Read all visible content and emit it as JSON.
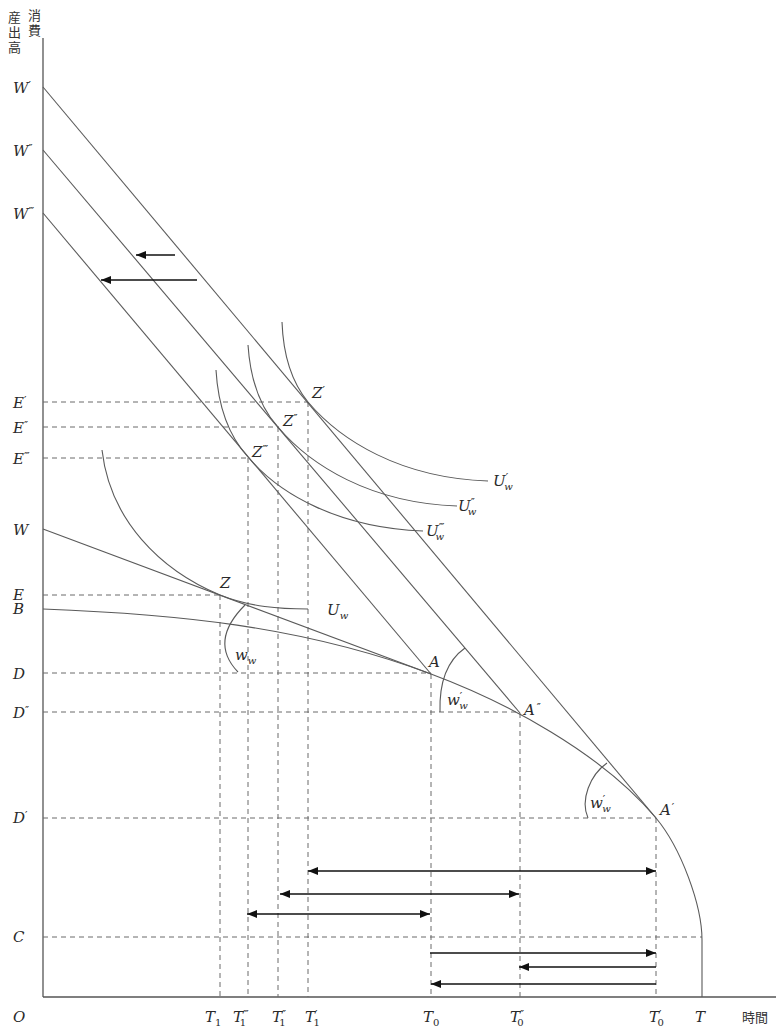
{
  "axis": {
    "y_title_col1": [
      "産",
      "出",
      "高"
    ],
    "y_title_col2": [
      "消",
      "費"
    ],
    "x_title": "時間",
    "origin": "O"
  },
  "y_axis_labels": [
    {
      "base": "W",
      "mark": "′"
    },
    {
      "base": "W",
      "mark": "″"
    },
    {
      "base": "W",
      "mark": "‴"
    },
    {
      "base": "E",
      "mark": "′"
    },
    {
      "base": "E",
      "mark": "″"
    },
    {
      "base": "E",
      "mark": "‴"
    },
    {
      "base": "W",
      "mark": ""
    },
    {
      "base": "E",
      "mark": ""
    },
    {
      "base": "B",
      "mark": ""
    },
    {
      "base": "D",
      "mark": ""
    },
    {
      "base": "D",
      "mark": "″"
    },
    {
      "base": "D",
      "mark": "′"
    },
    {
      "base": "C",
      "mark": ""
    }
  ],
  "x_axis_labels": [
    {
      "base": "T",
      "sub": "1",
      "mark": ""
    },
    {
      "base": "T",
      "sub": "1",
      "mark": "‴"
    },
    {
      "base": "T",
      "sub": "1",
      "mark": "″"
    },
    {
      "base": "T",
      "sub": "1",
      "mark": "′"
    },
    {
      "base": "T",
      "sub": "0",
      "mark": ""
    },
    {
      "base": "T",
      "sub": "0",
      "mark": "″"
    },
    {
      "base": "T",
      "sub": "0",
      "mark": "′"
    },
    {
      "base": "T",
      "sub": "",
      "mark": ""
    }
  ],
  "point_labels": [
    {
      "base": "Z",
      "mark": "′"
    },
    {
      "base": "Z",
      "mark": "″"
    },
    {
      "base": "Z",
      "mark": "‴"
    },
    {
      "base": "Z",
      "mark": ""
    },
    {
      "base": "A",
      "mark": ""
    },
    {
      "base": "A",
      "mark": "″"
    },
    {
      "base": "A",
      "mark": "′"
    }
  ],
  "curve_labels": [
    {
      "base": "U",
      "mark": "′",
      "sub": "w"
    },
    {
      "base": "U",
      "mark": "″",
      "sub": "w"
    },
    {
      "base": "U",
      "mark": "‴",
      "sub": "w"
    },
    {
      "base": "U",
      "mark": "",
      "sub": "w"
    }
  ],
  "angle_labels": [
    {
      "base": "w",
      "mark": "",
      "sub": "w"
    },
    {
      "base": "w",
      "mark": "′",
      "sub": "w"
    },
    {
      "base": "w",
      "mark": "′",
      "sub": "w"
    }
  ],
  "colors": {
    "line": "#5a5a5a",
    "arrow": "#111111",
    "guide": "#6a6a6a"
  }
}
